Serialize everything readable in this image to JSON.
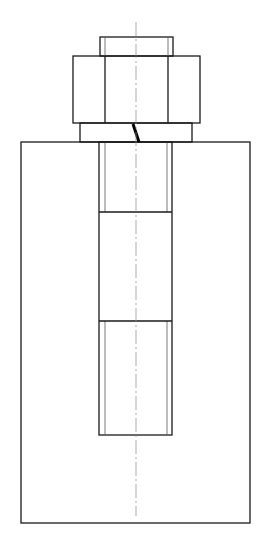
{
  "drawing": {
    "title": "Bolt, nut and washer assembly in threaded block (section view)",
    "colors": {
      "line": "#1a1a1a",
      "thin": "#555555",
      "center": "#888888",
      "background": "#ffffff"
    },
    "centerline": {
      "x": 136,
      "y1": 22,
      "y2": 516
    },
    "bolt_end": {
      "x": 100,
      "y": 37,
      "w": 73,
      "h": 19
    },
    "nut": {
      "x": 73,
      "y": 56,
      "w": 127,
      "h": 67,
      "inner_lines_x": [
        105,
        168
      ]
    },
    "washer": {
      "x": 80,
      "y": 123,
      "w": 112,
      "h": 19
    },
    "slit": {
      "x1": 133,
      "y1": 124,
      "x2": 139,
      "y2": 142
    },
    "block": {
      "x": 21,
      "y": 142,
      "w": 229,
      "h": 381
    },
    "hole": {
      "x": 99,
      "y": 142,
      "w": 73,
      "h": 293
    },
    "bolt_shank_bands_y": [
      212,
      321
    ],
    "thread_lines_x": [
      105,
      167
    ]
  }
}
